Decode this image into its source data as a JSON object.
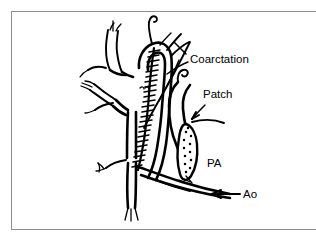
{
  "figure": {
    "title": "Aortic coarctation repair with patch",
    "frame_color": "#8d8d8d",
    "background_color": "#ffffff",
    "ink_color": "#000000",
    "labels": {
      "coarctation": "Coarctation",
      "patch": "Patch",
      "pa": "PA",
      "ao": "Ao"
    },
    "annotations": [
      {
        "name": "coarctation",
        "text": "Coarctation",
        "x": 190,
        "y": 63,
        "leader": "line",
        "points_to": "narrowed-aortic-segment"
      },
      {
        "name": "patch",
        "text": "Patch",
        "x": 203,
        "y": 98,
        "leader": "arrow",
        "points_to": "patch-graft"
      },
      {
        "name": "pa",
        "text": "PA",
        "x": 207,
        "y": 167,
        "leader": "none",
        "points_to": "pulmonary-artery"
      },
      {
        "name": "ao",
        "text": "Ao",
        "x": 243,
        "y": 196,
        "leader": "arrow",
        "points_to": "descending-aorta"
      }
    ],
    "structures": [
      {
        "name": "subclavian-artery",
        "kind": "vessel"
      },
      {
        "name": "carotid-artery",
        "kind": "vessel"
      },
      {
        "name": "aortic-arch",
        "kind": "vessel"
      },
      {
        "name": "narrowed-aortic-segment",
        "kind": "suture-line"
      },
      {
        "name": "patch-graft",
        "kind": "stippled-oval"
      },
      {
        "name": "pulmonary-artery",
        "kind": "vessel"
      },
      {
        "name": "descending-aorta",
        "kind": "vessel"
      }
    ]
  }
}
